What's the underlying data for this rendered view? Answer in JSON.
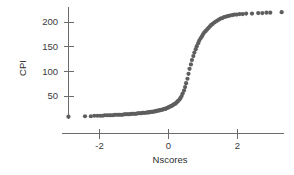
{
  "chart_data": {
    "type": "scatter",
    "title": "",
    "xlabel": "Nscores",
    "ylabel": "CPI",
    "xlim": [
      -3.35,
      3.55
    ],
    "ylim": [
      -8,
      232
    ],
    "grid": false,
    "legend": null,
    "marker": {
      "shape": "circle",
      "color": "#5e5e5e",
      "size": 2.1
    },
    "xticks": [
      -2,
      0,
      2
    ],
    "xticklabels": [
      "-2",
      "0",
      "2"
    ],
    "yticks": [
      50,
      100,
      150,
      200
    ],
    "yticklabels": [
      "50",
      "100",
      "150",
      "200"
    ],
    "x": [
      -2.9,
      -2.42,
      -2.25,
      -2.15,
      -2.06,
      -1.98,
      -1.91,
      -1.85,
      -1.78,
      -1.72,
      -1.67,
      -1.61,
      -1.56,
      -1.51,
      -1.46,
      -1.42,
      -1.37,
      -1.33,
      -1.28,
      -1.24,
      -1.2,
      -1.16,
      -1.12,
      -1.08,
      -1.04,
      -1.0,
      -0.97,
      -0.93,
      -0.89,
      -0.86,
      -0.82,
      -0.79,
      -0.75,
      -0.72,
      -0.68,
      -0.65,
      -0.61,
      -0.58,
      -0.55,
      -0.51,
      -0.48,
      -0.45,
      -0.41,
      -0.38,
      -0.35,
      -0.32,
      -0.28,
      -0.25,
      -0.22,
      -0.19,
      -0.15,
      -0.12,
      -0.09,
      -0.06,
      -0.03,
      0.0,
      0.03,
      0.06,
      0.09,
      0.12,
      0.15,
      0.19,
      0.22,
      0.25,
      0.28,
      0.32,
      0.35,
      0.38,
      0.41,
      0.45,
      0.48,
      0.51,
      0.55,
      0.58,
      0.61,
      0.65,
      0.68,
      0.72,
      0.75,
      0.79,
      0.82,
      0.86,
      0.89,
      0.93,
      0.97,
      1.0,
      1.04,
      1.08,
      1.12,
      1.16,
      1.2,
      1.24,
      1.28,
      1.33,
      1.37,
      1.42,
      1.46,
      1.51,
      1.56,
      1.61,
      1.67,
      1.72,
      1.78,
      1.85,
      1.91,
      1.98,
      2.06,
      2.15,
      2.25,
      2.42,
      2.6,
      2.72,
      2.84,
      2.95,
      3.28
    ],
    "y": [
      8,
      9,
      9,
      10,
      10,
      10,
      10,
      11,
      11,
      11,
      11,
      11,
      12,
      12,
      12,
      12,
      12,
      12,
      13,
      13,
      13,
      13,
      13,
      14,
      14,
      14,
      14,
      14,
      15,
      15,
      15,
      15,
      16,
      16,
      16,
      16,
      17,
      17,
      17,
      18,
      18,
      18,
      19,
      19,
      20,
      20,
      21,
      21,
      22,
      22,
      23,
      24,
      24,
      25,
      26,
      27,
      28,
      29,
      30,
      31,
      33,
      34,
      36,
      38,
      40,
      43,
      46,
      50,
      55,
      61,
      68,
      76,
      85,
      95,
      105,
      114,
      123,
      131,
      138,
      145,
      151,
      157,
      162,
      167,
      171,
      175,
      179,
      182,
      185,
      188,
      191,
      194,
      196,
      199,
      201,
      203,
      205,
      207,
      208,
      210,
      211,
      212,
      213,
      214,
      215,
      215,
      216,
      216,
      217,
      217,
      218,
      218,
      219,
      219,
      220
    ]
  },
  "axes": {
    "y_title": "CPI",
    "x_title": "Nscores"
  }
}
